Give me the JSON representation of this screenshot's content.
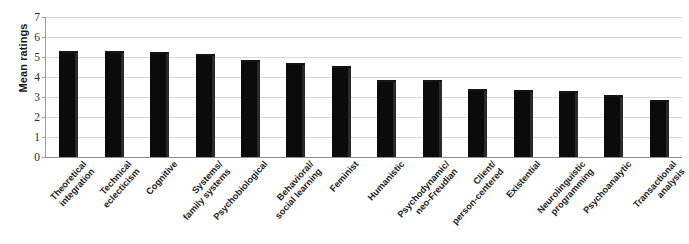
{
  "chart_data": {
    "type": "bar",
    "title": "",
    "xlabel": "",
    "ylabel": "Mean ratings",
    "ylim": [
      0,
      7
    ],
    "yticks": [
      0,
      1,
      2,
      3,
      4,
      5,
      6,
      7
    ],
    "grid": true,
    "legend": false,
    "bar_color": "#0b0b0b",
    "categories": [
      "Theoretical integration",
      "Technical eclecticism",
      "Cognitive",
      "Systems/ family systems",
      "Psychobiological",
      "Behavioral/ social learning",
      "Feminist",
      "Humanistic",
      "Psychodynamic/ neo-Freudian",
      "Client/ person-centered",
      "Existential",
      "Neurolinguistic programming",
      "Psychoanalytic",
      "Transactional analysis"
    ],
    "category_lines": [
      [
        "Theoretical",
        "integration"
      ],
      [
        "Technical",
        "eclecticism"
      ],
      [
        "Cognitive",
        ""
      ],
      [
        "Systems/",
        "family systems"
      ],
      [
        "Psychobiological",
        ""
      ],
      [
        "Behavioral/",
        "social learning"
      ],
      [
        "Feminist",
        ""
      ],
      [
        "Humanistic",
        ""
      ],
      [
        "Psychodynamic/",
        "neo-Freudian"
      ],
      [
        "Client/",
        "person-centered"
      ],
      [
        "Existential",
        ""
      ],
      [
        "Neurolinguistic",
        "programming"
      ],
      [
        "Psychoanalytic",
        ""
      ],
      [
        "Transactional",
        "analysis"
      ]
    ],
    "values": [
      5.3,
      5.3,
      5.25,
      5.15,
      4.85,
      4.7,
      4.55,
      3.85,
      3.85,
      3.4,
      3.35,
      3.3,
      3.1,
      2.85
    ],
    "bar_count": 15,
    "bar_values_rendered": [
      5.3,
      5.3,
      5.25,
      5.15,
      4.85,
      4.7,
      4.55,
      3.85,
      3.85,
      3.4,
      3.35,
      3.3,
      3.1,
      2.85
    ]
  }
}
